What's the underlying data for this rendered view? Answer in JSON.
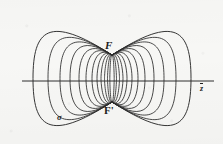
{
  "figure": {
    "caption_title": "Coaxial circles through two foci",
    "background_color": "#f7f7f5",
    "ink_color": "#2a2a2a",
    "width": 223,
    "height": 144
  },
  "labels": {
    "focus_top": "F",
    "focus_bottom": "F'",
    "surface": "σ",
    "axis": "z"
  },
  "chart_data": {
    "type": "line",
    "xlabel": "z",
    "ylabel": "",
    "grid": false,
    "legend": null,
    "xlim": [
      33,
      190
    ],
    "ylim": [
      27,
      129
    ],
    "annotations": [
      {
        "text": "F",
        "x": 112,
        "y": 52,
        "role": "upper-focus"
      },
      {
        "text": "F'",
        "x": 112,
        "y": 112,
        "role": "lower-focus"
      },
      {
        "text": "σ",
        "x": 62,
        "y": 117,
        "role": "surface-label"
      },
      {
        "text": "z",
        "x": 203,
        "y": 88,
        "role": "axis-label"
      }
    ],
    "axes": [
      {
        "name": "z-axis",
        "orientation": "horizontal",
        "x_start": 22,
        "x_end": 214,
        "y": 81
      }
    ],
    "foci": [
      {
        "name": "F",
        "x": 112,
        "y": 55
      },
      {
        "name": "F'",
        "x": 112,
        "y": 102
      }
    ],
    "series": [
      {
        "name": "left-lobe-arc-1",
        "side": "left",
        "half_width": 79
      },
      {
        "name": "left-lobe-arc-2",
        "side": "left",
        "half_width": 64
      },
      {
        "name": "left-lobe-arc-3",
        "side": "left",
        "half_width": 52
      },
      {
        "name": "left-lobe-arc-4",
        "side": "left",
        "half_width": 42
      },
      {
        "name": "left-lobe-arc-5",
        "side": "left",
        "half_width": 33
      },
      {
        "name": "left-lobe-arc-6",
        "side": "left",
        "half_width": 26
      },
      {
        "name": "left-lobe-arc-7",
        "side": "left",
        "half_width": 20
      },
      {
        "name": "left-lobe-arc-8",
        "side": "left",
        "half_width": 15
      },
      {
        "name": "left-lobe-arc-9",
        "side": "left",
        "half_width": 11
      },
      {
        "name": "left-lobe-arc-10",
        "side": "left",
        "half_width": 7.5
      },
      {
        "name": "left-lobe-arc-11",
        "side": "left",
        "half_width": 4.5
      },
      {
        "name": "left-lobe-arc-12",
        "side": "left",
        "half_width": 2.2
      },
      {
        "name": "right-lobe-arc-1",
        "side": "right",
        "half_width": 79
      },
      {
        "name": "right-lobe-arc-2",
        "side": "right",
        "half_width": 64
      },
      {
        "name": "right-lobe-arc-3",
        "side": "right",
        "half_width": 52
      },
      {
        "name": "right-lobe-arc-4",
        "side": "right",
        "half_width": 42
      },
      {
        "name": "right-lobe-arc-5",
        "side": "right",
        "half_width": 33
      },
      {
        "name": "right-lobe-arc-6",
        "side": "right",
        "half_width": 26
      },
      {
        "name": "right-lobe-arc-7",
        "side": "right",
        "half_width": 20
      },
      {
        "name": "right-lobe-arc-8",
        "side": "right",
        "half_width": 15
      },
      {
        "name": "right-lobe-arc-9",
        "side": "right",
        "half_width": 11
      },
      {
        "name": "right-lobe-arc-10",
        "side": "right",
        "half_width": 7.5
      },
      {
        "name": "right-lobe-arc-11",
        "side": "right",
        "half_width": 4.5
      },
      {
        "name": "right-lobe-arc-12",
        "side": "right",
        "half_width": 2.2
      }
    ]
  }
}
